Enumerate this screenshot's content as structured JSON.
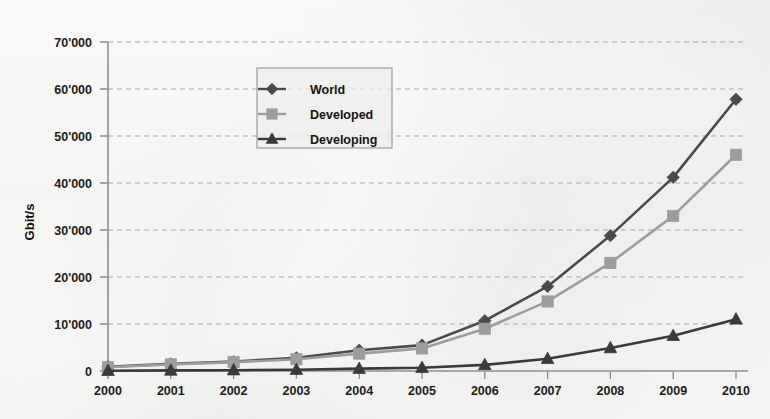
{
  "chart_data": {
    "type": "line",
    "title": "",
    "xlabel": "",
    "ylabel": "Gbit/s",
    "x": [
      2000,
      2001,
      2002,
      2003,
      2004,
      2005,
      2006,
      2007,
      2008,
      2009,
      2010
    ],
    "categories": [
      "2000",
      "2001",
      "2002",
      "2003",
      "2004",
      "2005",
      "2006",
      "2007",
      "2008",
      "2009",
      "2010"
    ],
    "ylim": [
      0,
      70000
    ],
    "ytick_values": [
      0,
      10000,
      20000,
      30000,
      40000,
      50000,
      60000,
      70000
    ],
    "ytick_labels": [
      "0",
      "10'000",
      "20'000",
      "30'000",
      "40'000",
      "50'000",
      "60'000",
      "70'000"
    ],
    "grid": "horizontal-dashed",
    "legend_position": "top-center",
    "series": [
      {
        "name": "World",
        "marker": "diamond",
        "color": "#4a4a4a",
        "values": [
          900,
          1500,
          2000,
          2800,
          4400,
          5500,
          10700,
          18000,
          28800,
          41200,
          57800
        ]
      },
      {
        "name": "Developed",
        "marker": "square",
        "color": "#9d9d9d",
        "values": [
          800,
          1400,
          1900,
          2500,
          3700,
          4800,
          9000,
          14800,
          23000,
          33000,
          46000
        ]
      },
      {
        "name": "Developing",
        "marker": "triangle",
        "color": "#3a3a3a",
        "values": [
          60,
          120,
          180,
          280,
          500,
          700,
          1300,
          2600,
          4900,
          7500,
          11000
        ]
      }
    ]
  },
  "legend": {
    "entries": [
      {
        "label": "World",
        "marker": "diamond-icon"
      },
      {
        "label": "Developed",
        "marker": "square-icon"
      },
      {
        "label": "Developing",
        "marker": "triangle-icon"
      }
    ]
  },
  "axes": {
    "y_axis_title": "Gbit/s"
  },
  "colors": {
    "background": "#ececea",
    "axis": "#8a8a8a",
    "grid": "#a8a8a8",
    "series_world": "#4a4a4a",
    "series_developed": "#9d9d9d",
    "series_developing": "#3a3a3a",
    "text": "#1c1c1c"
  }
}
